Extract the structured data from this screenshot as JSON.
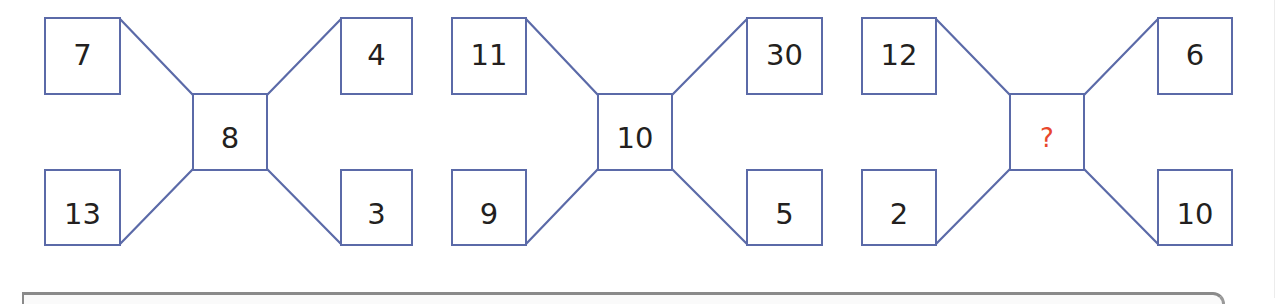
{
  "puzzle": {
    "type": "number-pattern",
    "line_color": "#5b6aa8",
    "text_color": "#231f20",
    "unknown_color": "#e8482c",
    "panels": [
      {
        "top_left": "7",
        "top_right": "4",
        "center": "8",
        "bottom_left": "13",
        "bottom_right": "3"
      },
      {
        "top_left": "11",
        "top_right": "30",
        "center": "10",
        "bottom_left": "9",
        "bottom_right": "5"
      },
      {
        "top_left": "12",
        "top_right": "6",
        "center": "?",
        "bottom_left": "2",
        "bottom_right": "10"
      }
    ]
  }
}
